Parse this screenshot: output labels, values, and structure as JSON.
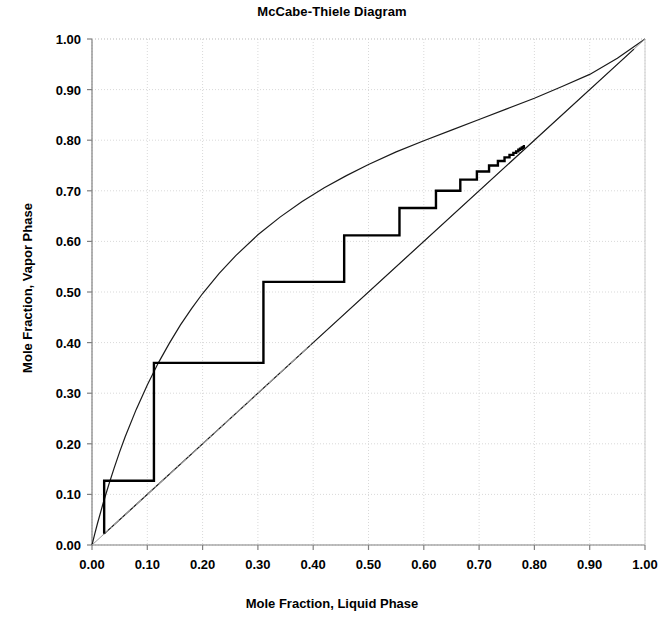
{
  "chart_data": {
    "type": "line",
    "title": "McCabe-Thiele Diagram",
    "xlabel": "Mole Fraction, Liquid Phase",
    "ylabel": "Mole Fraction, Vapor Phase",
    "xlim": [
      0.0,
      1.0
    ],
    "ylim": [
      0.0,
      1.0
    ],
    "xticks": [
      "0.00",
      "0.10",
      "0.20",
      "0.30",
      "0.40",
      "0.50",
      "0.60",
      "0.70",
      "0.80",
      "0.90",
      "1.00"
    ],
    "yticks": [
      "0.00",
      "0.10",
      "0.20",
      "0.30",
      "0.40",
      "0.50",
      "0.60",
      "0.70",
      "0.80",
      "0.90",
      "1.00"
    ],
    "xtick_values": [
      0.0,
      0.1,
      0.2,
      0.3,
      0.4,
      0.5,
      0.6,
      0.7,
      0.8,
      0.9,
      1.0
    ],
    "ytick_values": [
      0.0,
      0.1,
      0.2,
      0.3,
      0.4,
      0.5,
      0.6,
      0.7,
      0.8,
      0.9,
      1.0
    ],
    "grid": true,
    "grid_style": "dotted",
    "grid_color": "#d9d9d9",
    "legend": null,
    "series": [
      {
        "name": "equilibrium-curve",
        "style": "solid",
        "color": "#1a1a1a",
        "width": 1.2,
        "points": [
          [
            0.0,
            0.0
          ],
          [
            0.005,
            0.022
          ],
          [
            0.01,
            0.043
          ],
          [
            0.02,
            0.082
          ],
          [
            0.03,
            0.118
          ],
          [
            0.04,
            0.152
          ],
          [
            0.05,
            0.184
          ],
          [
            0.06,
            0.214
          ],
          [
            0.08,
            0.268
          ],
          [
            0.1,
            0.316
          ],
          [
            0.12,
            0.36
          ],
          [
            0.14,
            0.399
          ],
          [
            0.16,
            0.435
          ],
          [
            0.18,
            0.467
          ],
          [
            0.2,
            0.497
          ],
          [
            0.23,
            0.537
          ],
          [
            0.26,
            0.572
          ],
          [
            0.3,
            0.613
          ],
          [
            0.34,
            0.648
          ],
          [
            0.38,
            0.679
          ],
          [
            0.42,
            0.706
          ],
          [
            0.46,
            0.73
          ],
          [
            0.5,
            0.752
          ],
          [
            0.55,
            0.777
          ],
          [
            0.6,
            0.799
          ],
          [
            0.65,
            0.82
          ],
          [
            0.7,
            0.841
          ],
          [
            0.75,
            0.862
          ],
          [
            0.8,
            0.883
          ],
          [
            0.85,
            0.906
          ],
          [
            0.9,
            0.93
          ],
          [
            0.95,
            0.962
          ],
          [
            1.0,
            1.0
          ]
        ]
      },
      {
        "name": "diagonal-45-line",
        "style": "solid",
        "color": "#9a9a9a",
        "width": 1.0,
        "points": [
          [
            0.0,
            0.0
          ],
          [
            1.0,
            1.0
          ]
        ]
      },
      {
        "name": "operating-line-stripping",
        "style": "solid",
        "color": "#1a1a1a",
        "width": 1.2,
        "points": [
          [
            0.022,
            0.022
          ],
          [
            0.4,
            0.4
          ]
        ]
      },
      {
        "name": "operating-line-rectifying",
        "style": "solid",
        "color": "#1a1a1a",
        "width": 1.2,
        "points": [
          [
            0.4,
            0.4
          ],
          [
            0.98,
            0.98
          ]
        ]
      },
      {
        "name": "q-line",
        "style": "dashdot",
        "color": "#9a9a9a",
        "width": 1.1,
        "points": [
          [
            0.02,
            0.02
          ],
          [
            0.4,
            0.4
          ]
        ]
      },
      {
        "name": "stepping-staircase",
        "style": "solid",
        "color": "#000000",
        "width": 2.4,
        "points": [
          [
            0.022,
            0.022
          ],
          [
            0.022,
            0.127
          ],
          [
            0.112,
            0.127
          ],
          [
            0.112,
            0.36
          ],
          [
            0.31,
            0.36
          ],
          [
            0.31,
            0.52
          ],
          [
            0.456,
            0.52
          ],
          [
            0.456,
            0.612
          ],
          [
            0.556,
            0.612
          ],
          [
            0.556,
            0.666
          ],
          [
            0.622,
            0.666
          ],
          [
            0.622,
            0.7
          ],
          [
            0.666,
            0.7
          ],
          [
            0.666,
            0.722
          ],
          [
            0.696,
            0.722
          ],
          [
            0.696,
            0.738
          ],
          [
            0.718,
            0.738
          ],
          [
            0.718,
            0.75
          ],
          [
            0.734,
            0.75
          ],
          [
            0.734,
            0.759
          ],
          [
            0.746,
            0.759
          ],
          [
            0.746,
            0.766
          ],
          [
            0.755,
            0.766
          ],
          [
            0.755,
            0.771
          ],
          [
            0.762,
            0.771
          ],
          [
            0.762,
            0.775
          ],
          [
            0.767,
            0.775
          ],
          [
            0.767,
            0.778
          ],
          [
            0.771,
            0.778
          ],
          [
            0.771,
            0.781
          ],
          [
            0.774,
            0.781
          ],
          [
            0.774,
            0.783
          ],
          [
            0.777,
            0.783
          ],
          [
            0.777,
            0.785
          ],
          [
            0.779,
            0.785
          ],
          [
            0.779,
            0.786
          ],
          [
            0.781,
            0.786
          ],
          [
            0.781,
            0.788
          ],
          [
            0.783,
            0.788
          ]
        ]
      }
    ],
    "annotations": {
      "feed_stage_x": 0.4,
      "pinch_point": [
        0.783,
        0.788
      ],
      "bottoms_x": 0.022,
      "distillate_x": 0.98
    }
  }
}
